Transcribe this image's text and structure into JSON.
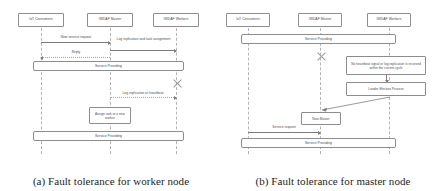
{
  "figures": [
    {
      "caption": "(a) Fault tolerance for worker node",
      "actors": [
        {
          "label": "IoT Consumers"
        },
        {
          "label": "IWDAF Master"
        },
        {
          "label": "IWDAF Workers"
        }
      ],
      "messages": [
        {
          "label": "New service request"
        },
        {
          "label": "Log replication and task assignment"
        },
        {
          "label": "Reply"
        },
        {
          "label": "Log replication or heartbeat"
        }
      ],
      "spans": [
        {
          "label": "Service Providing"
        },
        {
          "label": "Service Providing"
        }
      ],
      "notes": [
        {
          "label": "Assign task to a new worker"
        }
      ],
      "failure_marker": "failure-x-mark"
    },
    {
      "caption": "(b) Fault tolerance for master node",
      "actors": [
        {
          "label": "IoT Consumers"
        },
        {
          "label": "IWDAF Master"
        },
        {
          "label": "IWDAF Workers"
        }
      ],
      "messages": [
        {
          "label": "Service request"
        }
      ],
      "spans": [
        {
          "label": "Service Providing"
        },
        {
          "label": "Service Providing"
        }
      ],
      "notes": [
        {
          "label": "No heartbeat signal or log replication is received within the current cycle"
        },
        {
          "label": "Leader Election Process"
        },
        {
          "label": "New Master"
        }
      ],
      "failure_marker": "failure-x-mark"
    }
  ],
  "colors": {
    "stroke": "#8d8d8d",
    "lifeline": "#b4b4b4",
    "arrow": "#7d7d7d",
    "text": "#4a4a4a",
    "caption": "#1d1d1d",
    "background": "#ffffff"
  }
}
